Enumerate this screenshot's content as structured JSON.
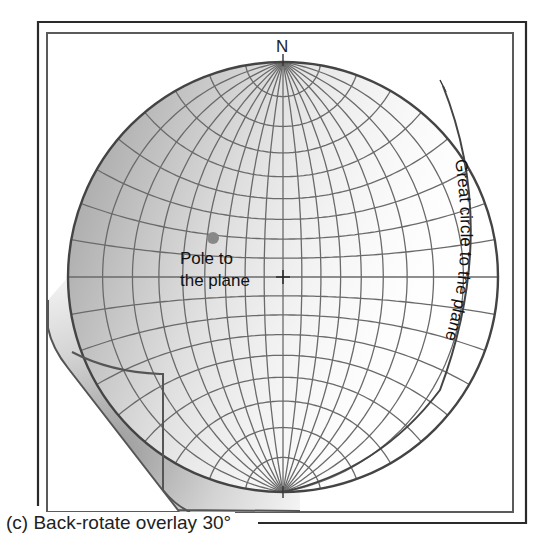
{
  "figure": {
    "caption": "(c) Back-rotate overlay 30°",
    "rotation_degrees": 30,
    "north_label": "N",
    "pole_label_line1": "Pole to",
    "pole_label_line2": "the plane",
    "great_circle_label": "Great circle to the plane"
  },
  "colors": {
    "frame": "#2a2a2a",
    "inner_frame": "#555555",
    "grid": "#6a6a6a",
    "primitive": "#444444",
    "pole_dot": "#888888",
    "shade_dark": "#8a8a8a",
    "shade_light": "#ffffff"
  }
}
